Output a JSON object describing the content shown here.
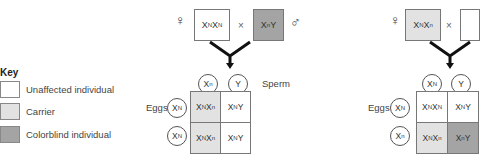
{
  "colors": {
    "unaffected": "#ffffff",
    "carrier": "#e2e2e2",
    "colorblind": "#a4a4a4"
  },
  "key": {
    "title": "Key",
    "items": [
      {
        "label": "Unaffected individual",
        "color": "#ffffff"
      },
      {
        "label": "Carrier",
        "color": "#e2e2e2"
      },
      {
        "label": "Colorblind individual",
        "color": "#a4a4a4"
      }
    ]
  },
  "cross1": {
    "female_symbol": "♀",
    "male_symbol": "♂",
    "times": "×",
    "female": "XNXN",
    "male": "XnY",
    "sperm_label": "Sperm",
    "eggs_label": "Eggs",
    "sperm": [
      "Xn",
      "Y"
    ],
    "eggs": [
      "XN",
      "XN"
    ],
    "grid": [
      [
        "XNXn",
        "XNY"
      ],
      [
        "XNXn",
        "XNY"
      ]
    ]
  },
  "cross2": {
    "female_symbol": "♀",
    "times": "×",
    "female": "XNXn",
    "eggs_label": "Eggs",
    "sperm": [
      "XN",
      "Y"
    ],
    "eggs": [
      "XN",
      "Xn"
    ],
    "grid": [
      [
        "XNXN",
        "XNY"
      ],
      [
        "XNXn",
        "XnY"
      ]
    ]
  }
}
